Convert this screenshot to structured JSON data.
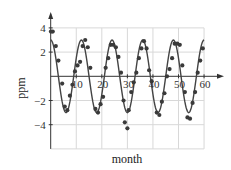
{
  "chart_data": {
    "type": "scatter",
    "title": "",
    "xlabel": "month",
    "ylabel": "ppm",
    "xlim": [
      0,
      60
    ],
    "ylim": [
      -6,
      4
    ],
    "grid": true,
    "xticks": [
      10,
      20,
      30,
      40,
      50,
      60
    ],
    "yticks": [
      4,
      2,
      -2,
      -4
    ],
    "series": [
      {
        "name": "observed",
        "kind": "scatter",
        "x": [
          0.1,
          0.8,
          2,
          3,
          4.5,
          5.5,
          6.5,
          7.5,
          8.5,
          9.5,
          10.5,
          11.5,
          12.5,
          13.5,
          14.5,
          15.5,
          17.5,
          18.5,
          19.5,
          20.5,
          21.5,
          22.5,
          23.5,
          24.5,
          25.5,
          26.5,
          27.5,
          28.5,
          29,
          30,
          30.5,
          31.5,
          32.5,
          33.5,
          34.5,
          35.5,
          36.5,
          37.5,
          38.5,
          39.5,
          41.5,
          42.5,
          43.5,
          44.5,
          45.5,
          46.5,
          47.5,
          48.5,
          49.5,
          50.5,
          51.5,
          52.5,
          53.5,
          54.5,
          55.5,
          56.5,
          57.5,
          58.5,
          59.5
        ],
        "y": [
          3.7,
          3.7,
          2.5,
          1.3,
          -0.6,
          -2.5,
          -2.8,
          -1.6,
          -0.7,
          0.4,
          0.9,
          1.2,
          2.5,
          3.0,
          2.4,
          0.7,
          -2.7,
          -3.0,
          -2.3,
          -1.7,
          0.7,
          1.5,
          2.6,
          2.6,
          2.4,
          1.6,
          0.3,
          -2.0,
          -3.8,
          -4.3,
          -2.8,
          -1.3,
          -0.5,
          0.3,
          1.5,
          2.3,
          2.9,
          2.3,
          0.5,
          -0.4,
          -3.0,
          -3.2,
          -2.1,
          -1.4,
          0.0,
          0.6,
          1.5,
          2.7,
          2.7,
          2.6,
          0.9,
          -1.3,
          -3.4,
          -3.5,
          -2.2,
          -1.3,
          0.3,
          1.3,
          2.3
        ]
      },
      {
        "name": "fit",
        "kind": "line",
        "formula": "3*cos(2*pi*t/12)",
        "amplitude": 3,
        "period": 12
      }
    ]
  },
  "axes": {
    "x_label": "month",
    "y_label": "ppm",
    "x_tick_labels": [
      "10",
      "20",
      "30",
      "40",
      "50",
      "60"
    ],
    "y_tick_labels": [
      "4",
      "2",
      "−2",
      "−4"
    ]
  },
  "colors": {
    "dot": "#3a3a3a",
    "curve": "#444444",
    "axis": "#333333",
    "grid": "#d8d8d8"
  }
}
